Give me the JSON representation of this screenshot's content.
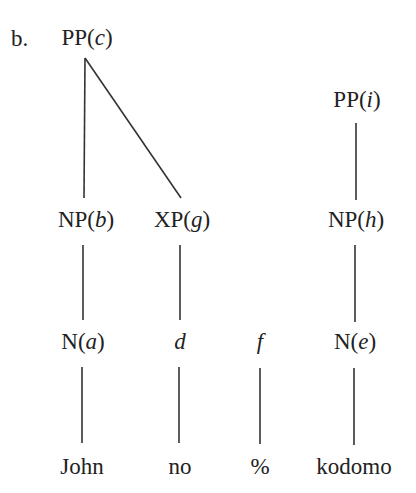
{
  "example_label": "b.",
  "tree1": {
    "root": {
      "cat": "PP",
      "index": "c"
    },
    "np": {
      "cat": "NP",
      "index": "b"
    },
    "xp": {
      "cat": "XP",
      "index": "g"
    },
    "n": {
      "cat": "N",
      "index": "a"
    },
    "d": {
      "index": "d"
    },
    "words": {
      "john": "John",
      "no": "no"
    }
  },
  "middle": {
    "f": {
      "index": "f"
    },
    "word": "%"
  },
  "tree2": {
    "root": {
      "cat": "PP",
      "index": "i"
    },
    "np": {
      "cat": "NP",
      "index": "h"
    },
    "n": {
      "cat": "N",
      "index": "e"
    },
    "word": "kodomo"
  },
  "edges": [
    {
      "from": "PP(c)",
      "to": "NP(b)"
    },
    {
      "from": "PP(c)",
      "to": "XP(g)"
    },
    {
      "from": "NP(b)",
      "to": "N(a)"
    },
    {
      "from": "XP(g)",
      "to": "d"
    },
    {
      "from": "N(a)",
      "to": "John"
    },
    {
      "from": "d",
      "to": "no"
    },
    {
      "from": "f",
      "to": "%"
    },
    {
      "from": "PP(i)",
      "to": "NP(h)"
    },
    {
      "from": "NP(h)",
      "to": "N(e)"
    },
    {
      "from": "N(e)",
      "to": "kodomo"
    }
  ]
}
